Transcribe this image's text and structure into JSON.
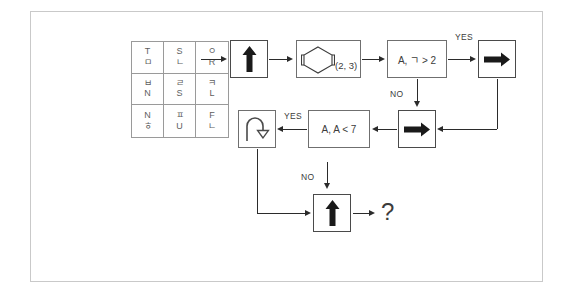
{
  "canvas": {
    "width": 573,
    "height": 294,
    "background": "#ffffff",
    "frame_color": "#c9c9c9"
  },
  "glyph_grid": {
    "name": "three-by-three-glyph-grid",
    "rows": [
      [
        {
          "top": "T",
          "bottom": "ㅁ"
        },
        {
          "top": "S",
          "bottom": "ㄴ"
        },
        {
          "top": "ㅇ",
          "bottom": "R"
        }
      ],
      [
        {
          "top": "ㅂ",
          "bottom": "N"
        },
        {
          "top": "ㄹ",
          "bottom": "S"
        },
        {
          "top": "ㅋ",
          "bottom": "L"
        }
      ],
      [
        {
          "top": "N",
          "bottom": "ㅎ"
        },
        {
          "top": "ㅍ",
          "bottom": "U"
        },
        {
          "top": "F",
          "bottom": "ㄴ"
        }
      ]
    ]
  },
  "flow": {
    "nodes": {
      "start_arrow_up": {
        "icon": "arrow-up-icon",
        "label": ""
      },
      "hexagon": {
        "icon": "hexagon-bracket-icon",
        "label": ""
      },
      "hexagon_params": "(2, 3)",
      "condition_one": "A, ㄱ > 2",
      "yes_arrow_right_top": {
        "icon": "arrow-right-icon",
        "label": ""
      },
      "no_arrow_right_mid": {
        "icon": "arrow-right-icon",
        "label": ""
      },
      "condition_two": "A, A < 7",
      "yes_arrow_uturn": {
        "icon": "arrow-uturn-icon",
        "label": ""
      },
      "final_arrow_up": {
        "icon": "arrow-up-icon",
        "label": ""
      },
      "question": "?"
    },
    "edge_labels": {
      "yes_top": "YES",
      "no_top": "NO",
      "yes_mid": "YES",
      "no_mid": "NO"
    }
  },
  "colors": {
    "stroke": "#2b2b2b",
    "box_border": "#6f6f6f",
    "grid_border": "#9a9a9a",
    "text": "#3c3c3c",
    "glyph_text": "#5e5e5e"
  }
}
